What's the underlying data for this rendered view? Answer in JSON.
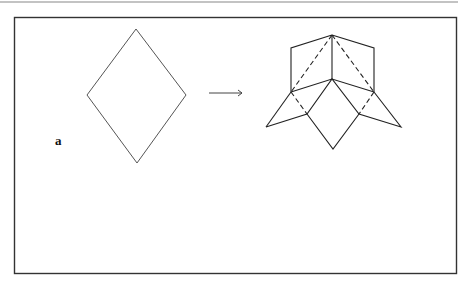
{
  "figure": {
    "panel_label": "a",
    "colors": {
      "stroke": "#333333",
      "frame": "#333333",
      "overlay_line": "#bbbbbb"
    }
  }
}
